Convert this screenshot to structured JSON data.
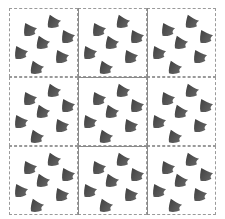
{
  "figure": {
    "rows": 3,
    "cols": 3,
    "tile_size_px": 69,
    "colors": {
      "background": "#ffffff",
      "shape_dark": "#3c3c3c",
      "shape_light": "#6a6a6a",
      "dashed_border": "#9a9a9a",
      "grid_line": "#8a8a8a"
    },
    "shapes_per_tile": [
      {
        "x": 12,
        "y": 12,
        "rotate": -15
      },
      {
        "x": 36,
        "y": 4,
        "rotate": -10
      },
      {
        "x": 50,
        "y": 19,
        "rotate": -15
      },
      {
        "x": 25,
        "y": 25,
        "rotate": -10
      },
      {
        "x": 3,
        "y": 35,
        "rotate": -15
      },
      {
        "x": 44,
        "y": 39,
        "rotate": -15
      },
      {
        "x": 19,
        "y": 50,
        "rotate": -10
      }
    ]
  }
}
